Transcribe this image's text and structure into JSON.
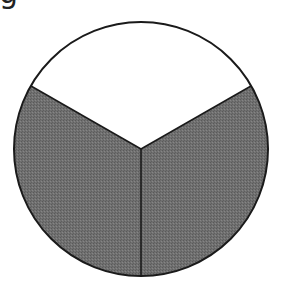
{
  "corner_label": "g",
  "diagram": {
    "type": "pie-fraction",
    "sectors_total": 3,
    "sectors_shaded": 2,
    "colors": {
      "shaded": "#6b6b6b",
      "unshaded": "#ffffff",
      "stroke": "#1a1a1a"
    }
  }
}
